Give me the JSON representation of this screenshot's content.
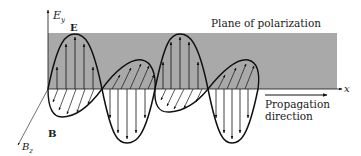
{
  "diagram": {
    "labels": {
      "e_axis": "E",
      "e_axis_sub": "y",
      "b_axis": "B",
      "b_axis_sub": "z",
      "x_axis": "x",
      "e_field": "E",
      "b_field": "B",
      "plane": "Plane of polarization",
      "propagation_line1": "Propagation",
      "propagation_line2": "direction"
    },
    "colors": {
      "plane": "#a9a9a9",
      "stroke": "#111111",
      "background": "#ffffff"
    }
  }
}
